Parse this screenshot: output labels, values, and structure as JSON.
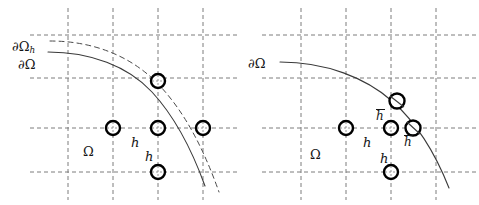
{
  "figure": {
    "type": "diagram",
    "width": 479,
    "height": 205,
    "background": "#ffffff",
    "stroke_color": "#333333",
    "grid_color": "#808080",
    "node_color": "#000000"
  },
  "panels": [
    {
      "id": "left",
      "name": "uniform-grid-panel",
      "labels": {
        "boundary_discrete": "∂Ω",
        "boundary_discrete_sub": "h",
        "boundary_exact": "∂Ω",
        "domain": "Ω",
        "spacing_horizontal": "h",
        "spacing_vertical": "h"
      },
      "grid": {
        "x_lines": [
          68,
          113,
          158,
          203
        ],
        "y_lines": [
          35,
          78,
          128,
          172
        ],
        "spacing": 45,
        "style": "dashed"
      },
      "nodes": [
        {
          "x": 158,
          "y": 81,
          "type": "grid-node"
        },
        {
          "x": 113,
          "y": 128,
          "type": "grid-node"
        },
        {
          "x": 158,
          "y": 128,
          "type": "grid-node"
        },
        {
          "x": 203,
          "y": 128,
          "type": "grid-node"
        },
        {
          "x": 158,
          "y": 172,
          "type": "grid-node"
        }
      ],
      "curves": [
        {
          "name": "exact-boundary",
          "style": "solid"
        },
        {
          "name": "discrete-boundary",
          "style": "dashed"
        }
      ]
    },
    {
      "id": "right",
      "name": "cut-cell-grid-panel",
      "labels": {
        "boundary_exact": "∂Ω",
        "domain": "Ω",
        "spacing_horizontal": "h",
        "spacing_vertical": "h",
        "spacing_cut_vertical": "h",
        "spacing_cut_horizontal": "h"
      },
      "grid": {
        "x_lines": [
          61,
          106,
          151,
          196
        ],
        "y_lines": [
          35,
          78,
          128,
          172
        ],
        "spacing": 45,
        "style": "dashed"
      },
      "nodes": [
        {
          "x": 157,
          "y": 101,
          "type": "cut-node"
        },
        {
          "x": 106,
          "y": 128,
          "type": "grid-node"
        },
        {
          "x": 151,
          "y": 128,
          "type": "grid-node"
        },
        {
          "x": 173,
          "y": 128,
          "type": "cut-node"
        },
        {
          "x": 151,
          "y": 172,
          "type": "grid-node"
        }
      ],
      "curves": [
        {
          "name": "exact-boundary",
          "style": "solid"
        }
      ]
    }
  ]
}
